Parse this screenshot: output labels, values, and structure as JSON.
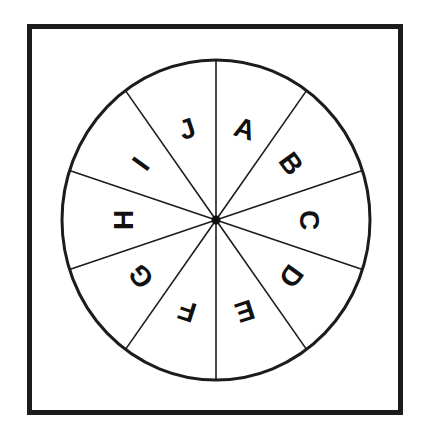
{
  "spinner": {
    "sector_count": 10,
    "sectors": [
      {
        "label": "A",
        "angle_deg": 18
      },
      {
        "label": "B",
        "angle_deg": 54
      },
      {
        "label": "C",
        "angle_deg": 90
      },
      {
        "label": "D",
        "angle_deg": 126
      },
      {
        "label": "E",
        "angle_deg": 162
      },
      {
        "label": "F",
        "angle_deg": 198
      },
      {
        "label": "G",
        "angle_deg": 234
      },
      {
        "label": "H",
        "angle_deg": 270
      },
      {
        "label": "I",
        "angle_deg": 306
      },
      {
        "label": "J",
        "angle_deg": 342
      }
    ],
    "colors": {
      "stroke": "#1c1c1c",
      "fill": "#ffffff",
      "text": "#111111"
    }
  }
}
